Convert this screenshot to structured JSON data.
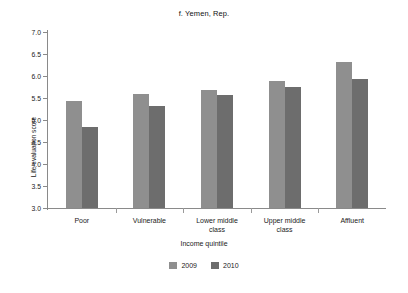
{
  "chart_data": {
    "type": "bar",
    "title": "f. Yemen, Rep.",
    "xlabel": "Income quintile",
    "ylabel": "Life evaluation score",
    "categories": [
      "Poor",
      "Vulnerable",
      "Lower middle class",
      "Upper middle class",
      "Affluent"
    ],
    "category_lines": [
      [
        "Poor"
      ],
      [
        "Vulnerable"
      ],
      [
        "Lower middle",
        "class"
      ],
      [
        "Upper middle",
        "class"
      ],
      [
        "Affluent"
      ]
    ],
    "series": [
      {
        "name": "2009",
        "color": "#8f8f8f",
        "values": [
          5.43,
          5.58,
          5.68,
          5.89,
          6.31
        ]
      },
      {
        "name": "2010",
        "color": "#6d6d6d",
        "values": [
          4.83,
          5.31,
          5.56,
          5.76,
          5.93
        ]
      }
    ],
    "ylim": [
      3.0,
      7.0
    ],
    "ytick_step": 0.5,
    "yticks": [
      "7.0",
      "6.5",
      "6.0",
      "5.5",
      "5.0",
      "4.5",
      "4.0",
      "3.5",
      "3.0"
    ],
    "ytick_values": [
      7.0,
      6.5,
      6.0,
      5.5,
      5.0,
      4.5,
      4.0,
      3.5,
      3.0
    ],
    "grid": false,
    "legend_position": "bottom"
  }
}
